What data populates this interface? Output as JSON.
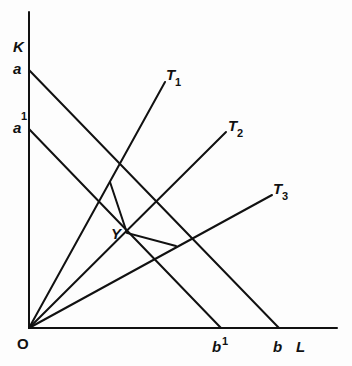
{
  "diagram": {
    "type": "isoquant-factor-intensity",
    "axes": {
      "y_label": "K",
      "x_label": "L",
      "origin_label": "O"
    },
    "budget_lines": [
      {
        "id": "ab",
        "start_label": "a",
        "end_label": "b"
      },
      {
        "id": "a1b1",
        "start_label": "a",
        "start_sup": "1",
        "end_label": "b",
        "end_sup": "1"
      }
    ],
    "rays": [
      {
        "id": "T1",
        "label": "T",
        "sub": "1"
      },
      {
        "id": "T2",
        "label": "T",
        "sub": "2"
      },
      {
        "id": "T3",
        "label": "T",
        "sub": "3"
      }
    ],
    "points": {
      "Y": {
        "label": "Y"
      }
    },
    "colors": {
      "line": "#111111",
      "background": "#fdfdfd"
    }
  }
}
